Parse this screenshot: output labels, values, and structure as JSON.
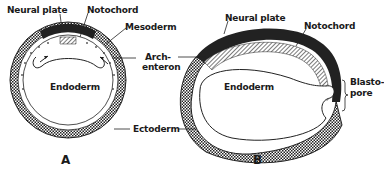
{
  "figure": {
    "panels": [
      {
        "id": "A",
        "label": "A",
        "description": "Cross-section of early gastrula (spherical embryo)",
        "structures": {
          "neural_plate": "Neural plate",
          "notochord": "Notochord",
          "mesoderm": "Mesoderm",
          "endoderm": "Endoderm",
          "ectoderm": "Ectoderm",
          "archenteron": "Arch-\nenteron"
        }
      },
      {
        "id": "B",
        "label": "B",
        "description": "Longitudinal section of elongated embryo",
        "structures": {
          "neural_plate": "Neural plate",
          "notochord": "Notochord",
          "endoderm": "Endoderm",
          "blastopore": "Blasto-\npore"
        }
      }
    ],
    "shared_labels": {
      "archenteron_line1": "Arch-",
      "archenteron_line2": "enteron",
      "ectoderm": "Ectoderm"
    },
    "colors": {
      "ink": "#1a1a1a",
      "neural_plate_fill": "#222222",
      "background": "#ffffff"
    }
  },
  "labels": {
    "a_neural_plate": "Neural plate",
    "a_notochord": "Notochord",
    "a_mesoderm": "Mesoderm",
    "a_endoderm": "Endoderm",
    "arch_1": "Arch-",
    "arch_2": "enteron",
    "ectoderm": "Ectoderm",
    "b_neural_plate": "Neural plate",
    "b_notochord": "Notochord",
    "b_endoderm": "Endoderm",
    "blasto_1": "Blasto-",
    "blasto_2": "pore",
    "panel_a": "A",
    "panel_b": "B"
  }
}
